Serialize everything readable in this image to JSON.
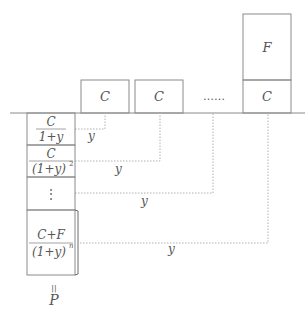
{
  "diagram": {
    "colors": {
      "line": "#8a8a8a",
      "dotted": "#b0b0b0",
      "text": "#555555"
    },
    "cash_flow_boxes": [
      {
        "label": "C"
      },
      {
        "label": "C"
      },
      {
        "label": "C"
      }
    ],
    "ellipsis": "……",
    "face_value_box": {
      "label": "F"
    },
    "present_value_column": [
      {
        "numerator": "C",
        "denominator": "1+y"
      },
      {
        "numerator": "C",
        "denominator": "(1+y)",
        "exponent": "2"
      },
      {
        "vdots": "⋮"
      },
      {
        "numerator": "C+F",
        "denominator": "(1+y)",
        "exponent": "n"
      }
    ],
    "discount_labels": [
      "y",
      "y",
      "y",
      "y"
    ],
    "equals_sign": "॥",
    "result_label": "P"
  }
}
